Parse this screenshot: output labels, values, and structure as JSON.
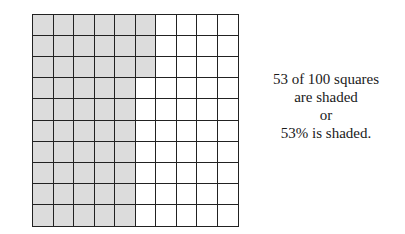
{
  "figure": {
    "grid": {
      "rows": 10,
      "columns": 10,
      "total_squares": 100,
      "shaded_squares": 53,
      "shaded_pattern": "columns 1-5 fully shaded; column 6 shaded in rows 1-3",
      "shaded_color": "#dcdcdc",
      "unshaded_color": "#ffffff",
      "line_color": "#222222"
    },
    "caption": {
      "line1": "53 of 100 squares",
      "line2": "are shaded",
      "line3": "or",
      "line4": "53% is shaded."
    }
  }
}
